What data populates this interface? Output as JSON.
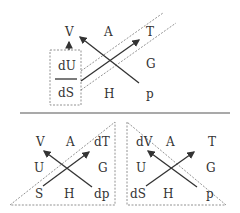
{
  "top": {
    "labels": {
      "V": "V",
      "A": "A",
      "T": "T",
      "G": "G",
      "H": "H",
      "p": "p"
    },
    "box": {
      "top": "dU",
      "bottom": "dS"
    }
  },
  "bottom_left": {
    "labels": {
      "V": "V",
      "A": "A",
      "dT": "dT",
      "U": "U",
      "G": "G",
      "S": "S",
      "H": "H",
      "dp": "dp"
    }
  },
  "bottom_right": {
    "labels": {
      "dV": "dV",
      "A": "A",
      "T": "T",
      "U": "U",
      "G": "G",
      "dS": "dS",
      "H": "H",
      "p": "p"
    }
  }
}
